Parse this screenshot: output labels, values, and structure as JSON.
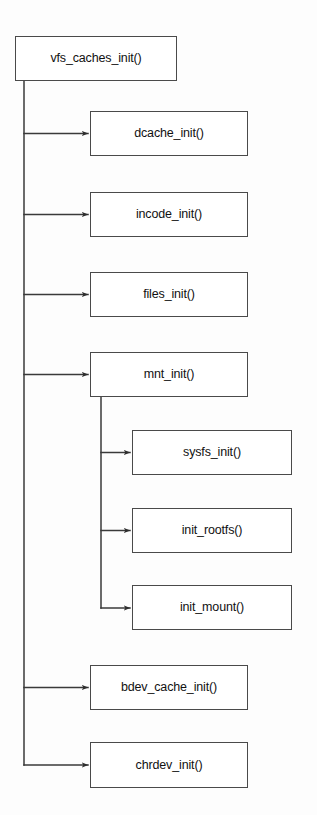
{
  "diagram": {
    "type": "flowchart",
    "orientation": "vertical-spine-with-right-branches",
    "background_color": "#fdfdfd",
    "box_fill_color": "#ffffff",
    "box_border_color": "#4a4a4a",
    "connector_color": "#3a3a3a",
    "text_color": "#111111",
    "root": {
      "id": "vfs-caches-init",
      "label": "vfs_caches_init()",
      "x": 15,
      "y": 36,
      "w": 162,
      "h": 45
    },
    "children": [
      {
        "id": "dcache-init",
        "label": "dcache_init()",
        "x": 90,
        "y": 111,
        "w": 158,
        "h": 45,
        "level": 1
      },
      {
        "id": "incode-init",
        "label": "incode_init()",
        "x": 90,
        "y": 192,
        "w": 158,
        "h": 45,
        "level": 1
      },
      {
        "id": "files-init",
        "label": "files_init()",
        "x": 90,
        "y": 272,
        "w": 158,
        "h": 45,
        "level": 1
      },
      {
        "id": "mnt-init",
        "label": "mnt_init()",
        "x": 90,
        "y": 352,
        "w": 158,
        "h": 45,
        "level": 1
      },
      {
        "id": "sysfs-init",
        "label": "sysfs_init()",
        "x": 132,
        "y": 430,
        "w": 160,
        "h": 45,
        "level": 2
      },
      {
        "id": "init-rootfs",
        "label": "init_rootfs()",
        "x": 132,
        "y": 508,
        "w": 160,
        "h": 45,
        "level": 2
      },
      {
        "id": "init-mount",
        "label": "init_mount()",
        "x": 132,
        "y": 585,
        "w": 160,
        "h": 45,
        "level": 2
      },
      {
        "id": "bdev-cache-init",
        "label": "bdev_cache_init()",
        "x": 90,
        "y": 665,
        "w": 158,
        "h": 45,
        "level": 1
      },
      {
        "id": "chrdev-init",
        "label": "chrdev_init()",
        "x": 90,
        "y": 742,
        "w": 158,
        "h": 46,
        "level": 1
      }
    ],
    "edges": [
      {
        "from": "vfs-caches-init",
        "to": "dcache-init"
      },
      {
        "from": "vfs-caches-init",
        "to": "incode-init"
      },
      {
        "from": "vfs-caches-init",
        "to": "files-init"
      },
      {
        "from": "vfs-caches-init",
        "to": "mnt-init"
      },
      {
        "from": "vfs-caches-init",
        "to": "bdev-cache-init"
      },
      {
        "from": "vfs-caches-init",
        "to": "chrdev-init"
      },
      {
        "from": "mnt-init",
        "to": "sysfs-init"
      },
      {
        "from": "mnt-init",
        "to": "init-rootfs"
      },
      {
        "from": "mnt-init",
        "to": "init-mount"
      }
    ],
    "spines": {
      "root_spine_x": 24,
      "root_spine_top": 81,
      "root_spine_bottom": 765,
      "mnt_spine_x": 101,
      "mnt_spine_top": 397,
      "mnt_spine_bottom": 608
    }
  }
}
